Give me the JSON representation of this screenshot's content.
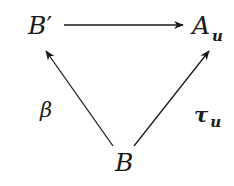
{
  "diagram": {
    "type": "commutative-triangle",
    "nodes": {
      "top_left": {
        "main": "B",
        "prime": "′"
      },
      "top_right": {
        "main": "A",
        "sub": "u"
      },
      "bottom": {
        "main": "B"
      }
    },
    "arrows": [
      {
        "from": "top_left",
        "to": "top_right",
        "label": ""
      },
      {
        "from": "bottom",
        "to": "top_left",
        "label": "β"
      },
      {
        "from": "bottom",
        "to": "top_right",
        "label_main": "τ",
        "label_sub": "u"
      }
    ],
    "labels": {
      "beta": "β",
      "tau_main": "τ",
      "tau_sub": "u"
    },
    "colors": {
      "ink": "#1a1a1a",
      "background": "#ffffff"
    }
  }
}
